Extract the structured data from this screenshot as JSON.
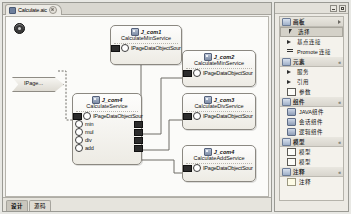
{
  "editor": {
    "tab": {
      "label": "Calculate.aic",
      "icon": "diagram-icon",
      "close": "close-icon"
    },
    "bottom_tabs": [
      {
        "label": "设计",
        "active": true
      },
      {
        "label": "源码",
        "active": false
      }
    ]
  },
  "canvas": {
    "start_marker": "start-node",
    "page_node": {
      "label": "IPage..."
    },
    "nodes": [
      {
        "id": "J_com1",
        "title": "J_com1",
        "service": "CalculateMinService",
        "interface": "IPageDataObjectSour",
        "ports": []
      },
      {
        "id": "J_com2",
        "title": "J_com2",
        "service": "CalculateMinService",
        "interface": "IPageDataObjectSour",
        "ports": []
      },
      {
        "id": "J_com3",
        "title": "J_com3",
        "service": "CalculateDivService",
        "interface": "IPageDataObjectSour",
        "ports": []
      },
      {
        "id": "J_com4",
        "title": "J_com4",
        "service": "CalculateAddService",
        "interface": "IPageDataObjectSour",
        "ports": []
      },
      {
        "id": "J_com5",
        "title": "J_com4",
        "service": "CalculateService",
        "interface": "IPageDataObjectSour",
        "ports": [
          "min",
          "mul",
          "div",
          "add"
        ]
      }
    ]
  },
  "palette": {
    "window_buttons": [
      "minimize-icon",
      "maximize-icon"
    ],
    "groups": [
      {
        "name": "画板",
        "icon": "folder-icon",
        "items": [
          {
            "label": "选择",
            "icon": "cursor-icon",
            "selected": true
          },
          {
            "label": "基点连接",
            "icon": "arrow-icon",
            "selected": false
          },
          {
            "label": "Promote 连接",
            "icon": "connection-icon",
            "selected": false
          }
        ]
      },
      {
        "name": "元素",
        "icon": "folder-icon",
        "items": [
          {
            "label": "服务",
            "icon": "arrow-icon",
            "selected": false
          },
          {
            "label": "引用",
            "icon": "arrow-icon",
            "selected": false
          },
          {
            "label": "参数",
            "icon": "box-icon",
            "selected": false
          }
        ]
      },
      {
        "name": "组件",
        "icon": "folder-icon",
        "items": [
          {
            "label": "JAVA组件",
            "icon": "component-icon",
            "selected": false
          },
          {
            "label": "会话组件",
            "icon": "component-icon",
            "selected": false
          },
          {
            "label": "逻辑组件",
            "icon": "component-icon",
            "selected": false
          }
        ]
      },
      {
        "name": "模型",
        "icon": "folder-icon",
        "items": [
          {
            "label": "模型",
            "icon": "box-icon",
            "selected": false
          },
          {
            "label": "模型",
            "icon": "box-icon",
            "selected": false
          }
        ]
      },
      {
        "name": "注释",
        "icon": "folder-icon",
        "items": [
          {
            "label": "注释",
            "icon": "note-icon",
            "selected": false
          }
        ]
      }
    ]
  }
}
